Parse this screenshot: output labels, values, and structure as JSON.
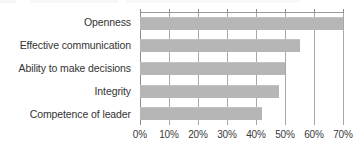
{
  "chart_data": {
    "type": "bar",
    "orientation": "horizontal",
    "title": "",
    "subtitle": "",
    "xlabel": "",
    "ylabel": "",
    "categories": [
      "Openness",
      "Effective communication",
      "Ability to make decisions",
      "Integrity",
      "Competence of leader"
    ],
    "values": [
      70,
      55,
      50,
      48,
      42
    ],
    "series": [
      {
        "name": "",
        "values": [
          70,
          55,
          50,
          48,
          42
        ]
      }
    ],
    "xlim": [
      0,
      70
    ],
    "ylim": null,
    "xticks": [
      0,
      10,
      20,
      30,
      40,
      50,
      60,
      70
    ],
    "xtick_labels": [
      "0%",
      "10%",
      "20%",
      "30%",
      "40%",
      "50%",
      "60%",
      "70%"
    ],
    "value_format": "percent",
    "grid": {
      "vertical": true,
      "horizontal": false
    },
    "legend": {
      "visible": false,
      "position": "none",
      "entries": []
    },
    "annotations": [],
    "colors": {
      "bar_fill": "#b6b6b6",
      "gridline": "#a8a8a8",
      "axis_line": "#8d8d8d",
      "label_text": "#333333",
      "tick_text": "#3a3a3a",
      "background": "#ffffff"
    }
  },
  "axis": {
    "x_tick_labels": [
      "0%",
      "10%",
      "20%",
      "30%",
      "40%",
      "50%",
      "60%",
      "70%"
    ]
  },
  "categories": {
    "items": [
      {
        "label": "Openness",
        "value": 70,
        "value_text": "70%"
      },
      {
        "label": "Effective communication",
        "value": 55,
        "value_text": "55%"
      },
      {
        "label": "Ability to make decisions",
        "value": 50,
        "value_text": "50%"
      },
      {
        "label": "Integrity",
        "value": 48,
        "value_text": "48%"
      },
      {
        "label": "Competence of leader",
        "value": 42,
        "value_text": "42%"
      }
    ]
  }
}
